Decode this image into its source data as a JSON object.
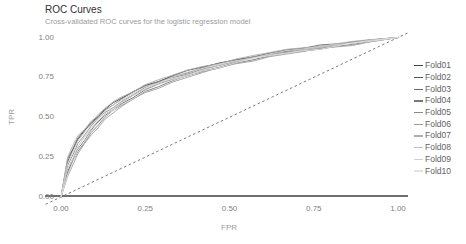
{
  "chart_data": {
    "type": "line",
    "title": "ROC Curves",
    "subtitle": "Cross-validated ROC curves for the logistic regression model",
    "xlabel": "FPR",
    "ylabel": "TPR",
    "xlim": [
      0,
      1
    ],
    "ylim": [
      0,
      1
    ],
    "grid": false,
    "legend_position": "right",
    "background_color": "#ffffff",
    "x_ticks": {
      "values": [
        0,
        0.25,
        0.5,
        0.75,
        1
      ],
      "labels": [
        "0.00",
        "0.25",
        "0.50",
        "0.75",
        "1.00"
      ]
    },
    "y_ticks": {
      "values": [
        0,
        0.25,
        0.5,
        0.75,
        1
      ],
      "labels": [
        "0.00",
        "0.25",
        "0.50",
        "0.75",
        "1.00"
      ]
    },
    "reference_line": {
      "shape": "diagonal",
      "from": [
        0,
        0
      ],
      "to": [
        1,
        1
      ],
      "style": "dashed",
      "color": "#6b6b6b"
    },
    "axis_line": {
      "at_tpr": 0,
      "color": "#3f3f3f"
    },
    "style_colors": {
      "title": "#303030",
      "subtitle": "#9b9b9b",
      "axis_text": "#7f7f7f",
      "axis_title": "#9b9b9b",
      "legend_text": "#5f5f5f"
    },
    "x": [
      0,
      0.02,
      0.05,
      0.09,
      0.13,
      0.18,
      0.25,
      0.33,
      0.42,
      0.52,
      0.62,
      0.72,
      0.82,
      0.91,
      1
    ],
    "series": [
      {
        "name": "Fold01",
        "color": "#454545",
        "tpr": [
          0,
          0.22,
          0.36,
          0.47,
          0.55,
          0.62,
          0.7,
          0.76,
          0.815,
          0.862,
          0.902,
          0.932,
          0.958,
          0.982,
          1
        ]
      },
      {
        "name": "Fold02",
        "color": "#565656",
        "tpr": [
          0,
          0.16,
          0.3,
          0.42,
          0.51,
          0.585,
          0.672,
          0.735,
          0.79,
          0.845,
          0.89,
          0.92,
          0.95,
          0.976,
          1
        ]
      },
      {
        "name": "Fold03",
        "color": "#686868",
        "tpr": [
          0,
          0.24,
          0.37,
          0.46,
          0.545,
          0.615,
          0.695,
          0.755,
          0.81,
          0.858,
          0.9,
          0.933,
          0.96,
          0.983,
          1
        ]
      },
      {
        "name": "Fold04",
        "color": "#797979",
        "tpr": [
          0,
          0.15,
          0.285,
          0.405,
          0.5,
          0.575,
          0.662,
          0.728,
          0.786,
          0.84,
          0.885,
          0.916,
          0.946,
          0.972,
          1
        ]
      },
      {
        "name": "Fold05",
        "color": "#8b8b8b",
        "tpr": [
          0,
          0.2,
          0.335,
          0.445,
          0.53,
          0.6,
          0.687,
          0.748,
          0.802,
          0.852,
          0.895,
          0.926,
          0.955,
          0.979,
          1
        ]
      },
      {
        "name": "Fold06",
        "color": "#9c9c9c",
        "tpr": [
          0,
          0.13,
          0.27,
          0.39,
          0.487,
          0.568,
          0.655,
          0.72,
          0.78,
          0.836,
          0.88,
          0.912,
          0.942,
          0.97,
          1
        ]
      },
      {
        "name": "Fold07",
        "color": "#aeaeae",
        "tpr": [
          0,
          0.25,
          0.385,
          0.475,
          0.555,
          0.628,
          0.705,
          0.763,
          0.818,
          0.865,
          0.906,
          0.936,
          0.962,
          0.985,
          1
        ]
      },
      {
        "name": "Fold08",
        "color": "#bfbfbf",
        "tpr": [
          0,
          0.18,
          0.315,
          0.43,
          0.52,
          0.592,
          0.678,
          0.74,
          0.796,
          0.848,
          0.892,
          0.922,
          0.952,
          0.977,
          1
        ]
      },
      {
        "name": "Fold09",
        "color": "#d1d1d1",
        "tpr": [
          0,
          0.21,
          0.35,
          0.455,
          0.538,
          0.608,
          0.692,
          0.752,
          0.806,
          0.855,
          0.898,
          0.929,
          0.957,
          0.981,
          1
        ]
      },
      {
        "name": "Fold10",
        "color": "#e2e2e2",
        "tpr": [
          0,
          0.14,
          0.295,
          0.415,
          0.505,
          0.58,
          0.668,
          0.732,
          0.79,
          0.843,
          0.887,
          0.918,
          0.948,
          0.974,
          1
        ]
      }
    ]
  },
  "legend": {
    "items": [
      "Fold01",
      "Fold02",
      "Fold03",
      "Fold04",
      "Fold05",
      "Fold06",
      "Fold07",
      "Fold08",
      "Fold09",
      "Fold10"
    ]
  }
}
